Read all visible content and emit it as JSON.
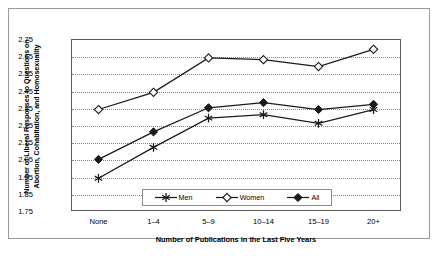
{
  "chart_data": {
    "type": "line",
    "title": "",
    "xlabel": "Number of Publications in the Last Five Years",
    "ylabel": "Number of Liberal Responses to Questions on Abortion, Cohabitation, and Homosexuality",
    "categories": [
      "None",
      "1–4",
      "5–9",
      "10–14",
      "15–19",
      "20+"
    ],
    "ylim": [
      1.75,
      2.75
    ],
    "yticks": [
      1.75,
      1.85,
      1.95,
      2.05,
      2.15,
      2.25,
      2.35,
      2.45,
      2.55,
      2.65,
      2.75
    ],
    "ytick_labels": [
      "1.75",
      "1.85",
      "1.95",
      "2.05",
      "2.15",
      "2.25",
      "2.35",
      "2.45",
      "2.55",
      "2.65",
      "2.75"
    ],
    "grid": true,
    "grid_style": "dotted-horizontal",
    "legend_position": "inside-bottom-center",
    "series": [
      {
        "name": "Men",
        "marker": "asterisk",
        "color": "#1a1a1a",
        "values": [
          1.94,
          2.12,
          2.29,
          2.31,
          2.26,
          2.34
        ]
      },
      {
        "name": "Women",
        "marker": "open-diamond",
        "color": "#1a1a1a",
        "values": [
          2.34,
          2.44,
          2.64,
          2.63,
          2.59,
          2.69
        ]
      },
      {
        "name": "All",
        "marker": "filled-diamond",
        "color": "#1a1a1a",
        "values": [
          2.05,
          2.21,
          2.35,
          2.38,
          2.34,
          2.37
        ]
      }
    ]
  },
  "legend": {
    "entries": [
      {
        "label": "Men"
      },
      {
        "label": "Women"
      },
      {
        "label": "All"
      }
    ]
  },
  "caption": {
    "text": ""
  }
}
